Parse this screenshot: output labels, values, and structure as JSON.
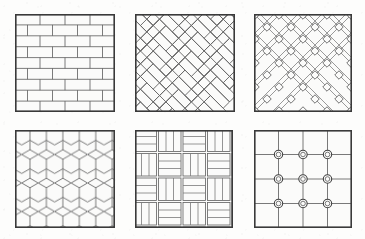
{
  "figure": {
    "background_color": "#fdfdfc",
    "ink_color": "#4a4a4a",
    "border_color": "#3a3a3a",
    "fill_color": "#fbfbfa",
    "columns": 3,
    "rows": 2,
    "swatch_count": 6
  },
  "swatches": [
    {
      "id": "running-bond-brick",
      "name": "Running bond brick",
      "position": {
        "x": 15,
        "y": 14,
        "width": 100,
        "height": 98
      },
      "pattern_type": "running-bond",
      "rows": 9,
      "bricks_per_row": 4,
      "row_height": 10.9,
      "brick_width": 25,
      "offset": 0.5,
      "line_width": 0.8,
      "border_width": 1.6
    },
    {
      "id": "herringbone",
      "name": "Herringbone",
      "position": {
        "x": 135,
        "y": 14,
        "width": 100,
        "height": 98
      },
      "pattern_type": "herringbone",
      "angle_degrees": 45,
      "plank_length": 26,
      "plank_width": 9,
      "line_width": 0.8,
      "border_width": 1.6
    },
    {
      "id": "diagonal-lattice",
      "name": "Diagonal lattice with diamond insets",
      "position": {
        "x": 254,
        "y": 14,
        "width": 98,
        "height": 98
      },
      "pattern_type": "diagonal-lattice",
      "angle_degrees": 45,
      "line_pair_gap": 3,
      "spacing": 24,
      "node_shape": "diamond",
      "node_size": 6,
      "line_width": 0.7,
      "border_width": 1.6
    },
    {
      "id": "hexagon-honeycomb",
      "name": "Hexagonal honeycomb",
      "position": {
        "x": 15,
        "y": 130,
        "width": 100,
        "height": 98
      },
      "pattern_type": "hexagon",
      "orientation": "pointy-top",
      "columns": 6,
      "rows": 8,
      "hex_radius": 9.5,
      "line_width": 0.9,
      "border_width": 1.6
    },
    {
      "id": "basketweave",
      "name": "Basketweave",
      "position": {
        "x": 135,
        "y": 130,
        "width": 98,
        "height": 98
      },
      "pattern_type": "basketweave",
      "block_size": 24.5,
      "blocks_per_side": 4,
      "slats_per_block": 3,
      "line_width": 0.8,
      "border_width": 1.6
    },
    {
      "id": "grid-with-studs",
      "name": "Square grid with circular studs",
      "position": {
        "x": 254,
        "y": 130,
        "width": 98,
        "height": 98
      },
      "pattern_type": "grid-studs",
      "grid_cells": 4,
      "cell_size": 24.5,
      "studs_across": 3,
      "studs_down": 3,
      "stud_outer_radius": 4.2,
      "stud_inner_radius": 2.3,
      "line_width": 0.9,
      "border_width": 1.6
    }
  ]
}
